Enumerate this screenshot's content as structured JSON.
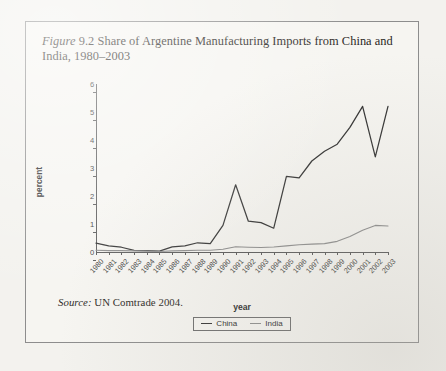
{
  "caption": {
    "figure_word": "Figure",
    "rest": " 9.2 Share of Argentine Manufacturing Imports from China and India, 1980–2003"
  },
  "source": {
    "label": "Source:",
    "text": " UN Comtrade 2004."
  },
  "legend": {
    "items": [
      {
        "label": "China",
        "color": "#333333"
      },
      {
        "label": "India",
        "color": "#8d8d8d"
      }
    ]
  },
  "chart_data": {
    "type": "line",
    "title": "Share of Argentine Manufacturing Imports from China and India, 1980–2003",
    "xlabel": "year",
    "ylabel": "percent",
    "ylim": [
      0,
      6
    ],
    "yticks": [
      0,
      1,
      2,
      3,
      4,
      5,
      6
    ],
    "grid": false,
    "legend_position": "bottom-center",
    "categories": [
      "1980",
      "1981",
      "1982",
      "1983",
      "1984",
      "1985",
      "1986",
      "1987",
      "1988",
      "1989",
      "1990",
      "1991",
      "1992",
      "1993",
      "1994",
      "1995",
      "1996",
      "1997",
      "1998",
      "1999",
      "2000",
      "2001",
      "2002",
      "2003"
    ],
    "series": [
      {
        "name": "China",
        "color": "#333333",
        "values": [
          0.32,
          0.22,
          0.17,
          0.06,
          0.05,
          0.03,
          0.18,
          0.22,
          0.33,
          0.3,
          0.95,
          2.4,
          1.1,
          1.05,
          0.85,
          2.7,
          2.65,
          3.25,
          3.6,
          3.85,
          4.45,
          5.2,
          3.4,
          5.2
        ]
      },
      {
        "name": "India",
        "color": "#8d8d8d",
        "values": [
          0.06,
          0.05,
          0.05,
          0.04,
          0.03,
          0.02,
          0.04,
          0.05,
          0.06,
          0.06,
          0.1,
          0.19,
          0.17,
          0.16,
          0.18,
          0.22,
          0.26,
          0.28,
          0.3,
          0.38,
          0.55,
          0.78,
          0.95,
          0.93
        ]
      }
    ]
  }
}
